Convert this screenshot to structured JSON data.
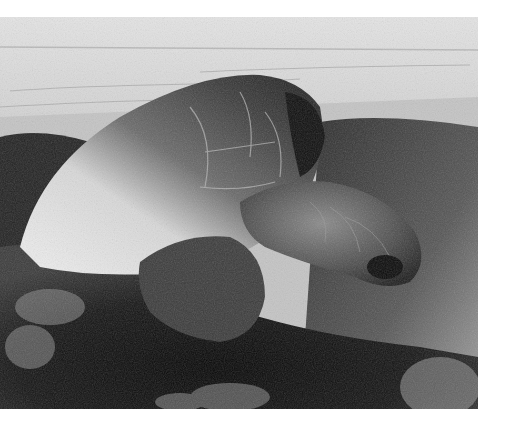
{
  "image": {
    "alt": "Black-and-white photograph of a large sea turtle nesting in sand on a beach, with the sea and horizon in the background",
    "subject": "sea turtle",
    "setting": "beach",
    "tone": "grayscale",
    "colors": {
      "page_background": "#ffffff",
      "sky": "#dcdcdc",
      "sea": "#c8c8c8",
      "sand_light": "#bdbdbd",
      "sand_dark": "#1a1a1a",
      "shell_highlight": "#e6e6e6",
      "shell_shadow": "#3a3a3a"
    }
  }
}
